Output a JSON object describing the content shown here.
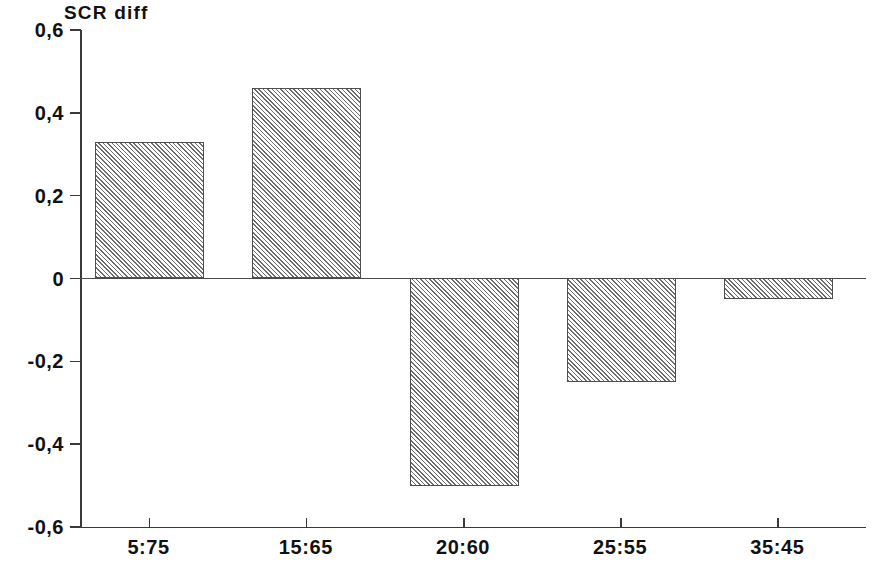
{
  "chart_data": {
    "type": "bar",
    "title": "SCR diff",
    "xlabel": "",
    "ylabel": "",
    "categories": [
      "5:75",
      "15:65",
      "20:60",
      "25:55",
      "35:45"
    ],
    "values": [
      0.33,
      0.46,
      -0.5,
      -0.25,
      -0.05
    ],
    "ylim": [
      -0.6,
      0.6
    ],
    "ytick_values": [
      0.6,
      0.4,
      0.2,
      0,
      -0.2,
      -0.4,
      -0.6
    ],
    "ytick_labels": [
      "0,6",
      "0,4",
      "0,2",
      "0",
      "-0,2",
      "-0,4",
      "-0,6"
    ],
    "grid": false,
    "legend": null,
    "legend_position": "none",
    "bar_fill": "diagonal-hatch",
    "bar_fill_color": "#6e6e6e",
    "bar_edge_color": "#4f4f4f",
    "axis_color": "#3a3a3a",
    "background_color": "#ffffff",
    "zero_line": 0
  }
}
